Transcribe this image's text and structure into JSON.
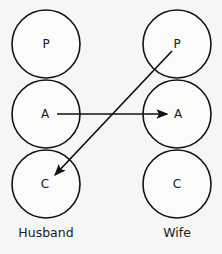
{
  "diagram": {
    "background_color": "#f6f6f4",
    "stroke_color": "#111111",
    "circle_fill": "#fbfbfa",
    "columns": [
      {
        "name": "husband",
        "footer_label": "Husband",
        "footer_x": 46,
        "footer_y": 233,
        "center_x": 46,
        "states": [
          {
            "id": "husband-parent",
            "label": "P",
            "cx": 46,
            "cy": 44,
            "r": 34
          },
          {
            "id": "husband-adult",
            "label": "A",
            "cx": 46,
            "cy": 114,
            "r": 34
          },
          {
            "id": "husband-child",
            "label": "C",
            "cx": 46,
            "cy": 184,
            "r": 34
          }
        ]
      },
      {
        "name": "wife",
        "footer_label": "Wife",
        "footer_x": 177,
        "footer_y": 233,
        "center_x": 177,
        "states": [
          {
            "id": "wife-parent",
            "label": "P",
            "cx": 177,
            "cy": 44,
            "r": 34
          },
          {
            "id": "wife-adult",
            "label": "A",
            "cx": 177,
            "cy": 114,
            "r": 34
          },
          {
            "id": "wife-child",
            "label": "C",
            "cx": 177,
            "cy": 184,
            "r": 34
          }
        ]
      }
    ],
    "arrows": [
      {
        "id": "arrow-husband-adult-to-wife-adult",
        "label": "",
        "from": "husband-adult",
        "to": "wife-adult",
        "x1": 57,
        "y1": 114,
        "x2": 167,
        "y2": 114
      },
      {
        "id": "arrow-wife-parent-to-husband-child",
        "label": "",
        "from": "wife-parent",
        "to": "husband-child",
        "x1": 172,
        "y1": 51,
        "x2": 55,
        "y2": 175
      }
    ]
  }
}
